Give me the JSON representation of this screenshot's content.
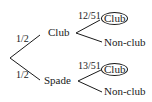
{
  "tree": {
    "root": {
      "branches": [
        {
          "prob": "1/2",
          "label": "Club",
          "children": [
            {
              "prob": "12/51",
              "label": "Club",
              "circled": true
            },
            {
              "prob": "",
              "label": "Non-club",
              "circled": false
            }
          ]
        },
        {
          "prob": "1/2",
          "label": "Spade",
          "children": [
            {
              "prob": "13/51",
              "label": "Club",
              "circled": true
            },
            {
              "prob": "",
              "label": "Non-club",
              "circled": false
            }
          ]
        }
      ]
    }
  },
  "colors": {
    "line": "#1a1a1a",
    "background": "#ffffff"
  }
}
